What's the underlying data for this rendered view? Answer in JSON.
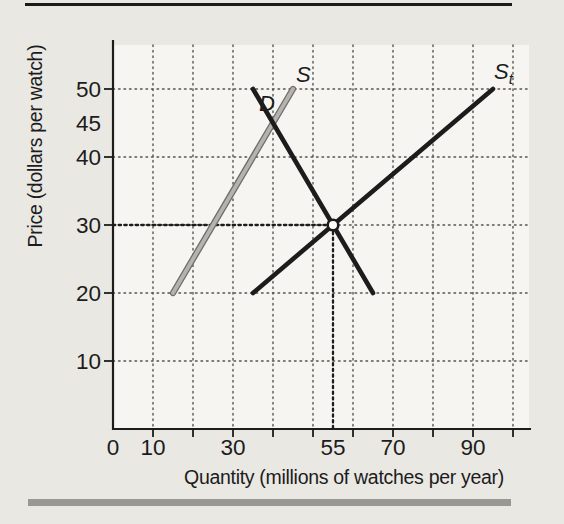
{
  "figure": {
    "page_bg": "#eae8e3",
    "plot_bg": "#f6f5f1",
    "top_rule_color": "#1b1b1b",
    "bottom_bar_color": "#9a9893",
    "grid_color": "#55534f",
    "axis_color": "#1c1c1c",
    "equilibrium_marker_fill": "#fdfdfb"
  },
  "chart_data": {
    "type": "line",
    "title": "",
    "xlabel": "Quantity (millions of watches per year)",
    "ylabel": "Price (dollars per watch)",
    "xlim": [
      0,
      104
    ],
    "ylim": [
      0,
      56.5
    ],
    "grid": {
      "style": "dotted",
      "x_values": [
        10,
        20,
        30,
        40,
        50,
        60,
        70,
        80,
        90,
        100
      ],
      "y_values": [
        10,
        20,
        30,
        40,
        50
      ]
    },
    "x_ticks": [
      10,
      20,
      30,
      40,
      50,
      60,
      70,
      80,
      90,
      100
    ],
    "y_ticks": [
      10,
      20,
      30,
      40,
      50
    ],
    "x_tick_labels": [
      {
        "value": 0,
        "label": "0"
      },
      {
        "value": 10,
        "label": "10"
      },
      {
        "value": 30,
        "label": "30"
      },
      {
        "value": 55,
        "label": "55"
      },
      {
        "value": 70,
        "label": "70"
      },
      {
        "value": 90,
        "label": "90"
      }
    ],
    "y_tick_labels": [
      {
        "value": 10,
        "label": "10"
      },
      {
        "value": 20,
        "label": "20"
      },
      {
        "value": 30,
        "label": "30"
      },
      {
        "value": 40,
        "label": "40"
      },
      {
        "value": 45,
        "label": "45"
      },
      {
        "value": 50,
        "label": "50"
      }
    ],
    "series": [
      {
        "name": "s",
        "label": "S",
        "label_sub": "",
        "color": "gray",
        "points": [
          [
            15,
            20
          ],
          [
            45,
            50
          ]
        ]
      },
      {
        "name": "st",
        "label": "S",
        "label_sub": "t",
        "color": "#1c1c1c",
        "points": [
          [
            35,
            20
          ],
          [
            95,
            50
          ]
        ]
      },
      {
        "name": "d",
        "label": "D",
        "label_sub": "",
        "color": "#1c1c1c",
        "points": [
          [
            35,
            50
          ],
          [
            65,
            20
          ]
        ]
      }
    ],
    "equilibrium": {
      "x": 55,
      "y": 30,
      "marker": "open-circle"
    },
    "legend": "none"
  }
}
